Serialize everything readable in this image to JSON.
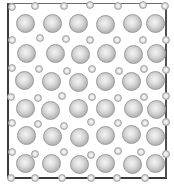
{
  "figure": {
    "frame_color": "#3a3a3a",
    "large_atom_color": "#c8c8c8",
    "small_atom_color": "#e0e0e0"
  },
  "large_atoms": [
    [
      25,
      23
    ],
    [
      52,
      23
    ],
    [
      78,
      23
    ],
    [
      105,
      24
    ],
    [
      132,
      23
    ],
    [
      155,
      23
    ],
    [
      26,
      53
    ],
    [
      55,
      53
    ],
    [
      80,
      54
    ],
    [
      106,
      53
    ],
    [
      133,
      54
    ],
    [
      156,
      53
    ],
    [
      24,
      80
    ],
    [
      51,
      81
    ],
    [
      78,
      82
    ],
    [
      105,
      81
    ],
    [
      131,
      81
    ],
    [
      155,
      80
    ],
    [
      25,
      108
    ],
    [
      50,
      110
    ],
    [
      78,
      108
    ],
    [
      105,
      108
    ],
    [
      133,
      108
    ],
    [
      156,
      109
    ],
    [
      26,
      135
    ],
    [
      52,
      136
    ],
    [
      79,
      137
    ],
    [
      105,
      135
    ],
    [
      131,
      134
    ],
    [
      155,
      136
    ],
    [
      25,
      163
    ],
    [
      51,
      163
    ],
    [
      79,
      164
    ],
    [
      105,
      163
    ],
    [
      132,
      164
    ],
    [
      155,
      163
    ]
  ],
  "small_atoms": [
    [
      12,
      7
    ],
    [
      35,
      6
    ],
    [
      64,
      6
    ],
    [
      90,
      5
    ],
    [
      118,
      6
    ],
    [
      143,
      5
    ],
    [
      165,
      6
    ],
    [
      12,
      40
    ],
    [
      40,
      38
    ],
    [
      66,
      39
    ],
    [
      90,
      40
    ],
    [
      117,
      40
    ],
    [
      143,
      40
    ],
    [
      166,
      40
    ],
    [
      12,
      68
    ],
    [
      39,
      69
    ],
    [
      67,
      71
    ],
    [
      92,
      69
    ],
    [
      119,
      71
    ],
    [
      144,
      69
    ],
    [
      166,
      70
    ],
    [
      11,
      97
    ],
    [
      38,
      98
    ],
    [
      62,
      96
    ],
    [
      92,
      97
    ],
    [
      118,
      98
    ],
    [
      144,
      97
    ],
    [
      166,
      96
    ],
    [
      12,
      123
    ],
    [
      38,
      124
    ],
    [
      64,
      126
    ],
    [
      91,
      122
    ],
    [
      118,
      123
    ],
    [
      145,
      123
    ],
    [
      166,
      122
    ],
    [
      12,
      152
    ],
    [
      35,
      154
    ],
    [
      64,
      152
    ],
    [
      91,
      155
    ],
    [
      118,
      151
    ],
    [
      141,
      152
    ],
    [
      166,
      154
    ],
    [
      11,
      178
    ],
    [
      35,
      178
    ],
    [
      62,
      178
    ],
    [
      91,
      178
    ],
    [
      117,
      178
    ],
    [
      145,
      178
    ]
  ]
}
